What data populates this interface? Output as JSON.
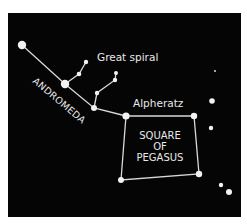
{
  "diagram": {
    "background": "#050505",
    "star_color": "#f2f2f2",
    "line_color": "#d8d8d8",
    "labels": {
      "great_spiral": "Great spiral",
      "andromeda": "ANDROMEDA",
      "alpheratz": "Alpheratz",
      "square_line1": "SQUARE",
      "square_line2": "OF",
      "square_line3": "PEGASUS"
    }
  }
}
